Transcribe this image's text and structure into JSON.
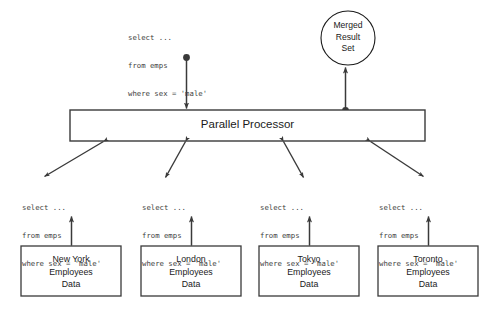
{
  "diagram": {
    "colors": {
      "stroke": "#3a3a3a",
      "text": "#1a1a1a",
      "sql_text": "#404040",
      "background": "#ffffff"
    },
    "processor": {
      "label": "Parallel Processor"
    },
    "result": {
      "label_line1": "Merged",
      "label_line2": "Result",
      "label_line3": "Set"
    },
    "input_query": {
      "line1": "select ...",
      "line2": "from emps",
      "line3": "where sex = 'male'"
    },
    "branch_queries": [
      {
        "line1": "select ...",
        "line2": "from emps",
        "line3": "where sex = 'male'"
      },
      {
        "line1": "select ...",
        "line2": "from emps",
        "line3": "where sex = 'male'"
      },
      {
        "line1": "select ...",
        "line2": "from emps",
        "line3": "where sex = 'male'"
      },
      {
        "line1": "select ...",
        "line2": "from emps",
        "line3": "where sex = 'male'"
      }
    ],
    "data_stores": [
      {
        "line1": "New York",
        "line2": "Employees",
        "line3": "Data"
      },
      {
        "line1": "London",
        "line2": "Employees",
        "line3": "Data"
      },
      {
        "line1": "Tokyo",
        "line2": "Employees",
        "line3": "Data"
      },
      {
        "line1": "Toronto",
        "line2": "Employees",
        "line3": "Data"
      }
    ]
  }
}
